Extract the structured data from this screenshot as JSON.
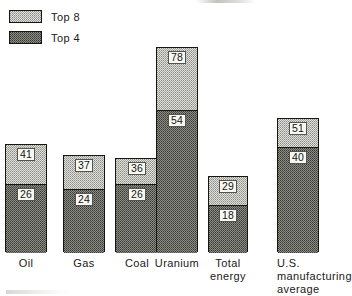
{
  "legend": {
    "items": [
      {
        "label": "Top 8",
        "key": "top8",
        "swatch": "light-stipple"
      },
      {
        "label": "Top 4",
        "key": "top4",
        "swatch": "dark-stipple"
      }
    ]
  },
  "chart_data": {
    "type": "bar",
    "title": "",
    "xlabel": "",
    "ylabel": "",
    "ylim": [
      0,
      80
    ],
    "grid": false,
    "legend_position": "top-left",
    "stacked_display": "top4 is a nested subset drawn inside the full top8 bar",
    "categories": [
      "Oil",
      "Gas",
      "Coal",
      "Uranium",
      "Total energy",
      "U.S. manufacturing average"
    ],
    "series": [
      {
        "name": "Top 8",
        "values": [
          41,
          37,
          36,
          78,
          29,
          51
        ]
      },
      {
        "name": "Top 4",
        "values": [
          26,
          24,
          26,
          54,
          18,
          40
        ]
      }
    ],
    "bars": [
      {
        "category": "Oil",
        "label_lines": "Oil",
        "top8": 41,
        "top4": 26
      },
      {
        "category": "Gas",
        "label_lines": "Gas",
        "top8": 37,
        "top4": 24
      },
      {
        "category": "Coal",
        "label_lines": "Coal",
        "top8": 36,
        "top4": 26
      },
      {
        "category": "Uranium",
        "label_lines": "Uranium",
        "top8": 78,
        "top4": 54
      },
      {
        "category": "Total energy",
        "label_lines": "Total\nenergy",
        "top8": 29,
        "top4": 18
      },
      {
        "category": "U.S. manufacturing average",
        "label_lines": "U.S.\nmanufacturing\naverage",
        "top8": 51,
        "top4": 40
      }
    ]
  },
  "colors": {
    "ink": "#17170f",
    "top8_fill": "#dededa",
    "top4_fill": "#8a8a85",
    "background": "#ffffff"
  }
}
